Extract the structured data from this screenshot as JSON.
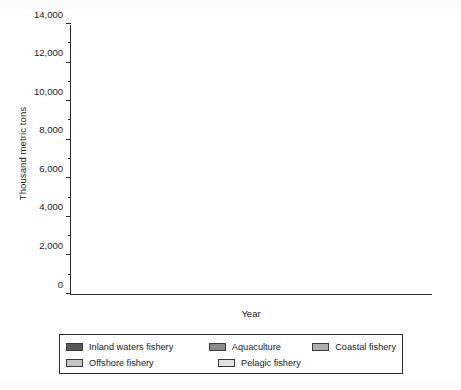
{
  "axes": {
    "y_title": "Thousand metric tons",
    "x_title": "Year",
    "y_ticks": [
      "0",
      "2,000",
      "4,000",
      "6,000",
      "8,000",
      "10,000",
      "12,000",
      "14,000"
    ],
    "x_ticks": [
      "1980",
      "1990",
      "2000"
    ]
  },
  "legend": {
    "items": [
      {
        "label": "Inland waters fishery",
        "color": "#58585a"
      },
      {
        "label": "Aquaculture",
        "color": "#8a8a8c"
      },
      {
        "label": "Coastal fishery",
        "color": "#aeaeb0"
      },
      {
        "label": "Offshore fishery",
        "color": "#c6c6c8"
      },
      {
        "label": "Pelagic fishery",
        "color": "#e2e2e3"
      }
    ]
  },
  "chart_data": {
    "type": "bar",
    "stacked": true,
    "title": "",
    "xlabel": "Year",
    "ylabel": "Thousand metric tons",
    "ylim": [
      0,
      14000
    ],
    "ytick_step": 2000,
    "grid": false,
    "legend_position": "bottom",
    "categories": [
      "1979",
      "1980",
      "1981",
      "1982",
      "1983",
      "1984",
      "1985",
      "1986",
      "1987",
      "1988",
      "1989",
      "1990",
      "1991",
      "1992",
      "1993",
      "1994",
      "1995",
      "1996",
      "1997",
      "1998",
      "1999",
      "2000",
      "2001",
      "2002",
      "2003",
      "2004"
    ],
    "series": [
      {
        "name": "Pelagic fishery",
        "color": "#e2e2e3",
        "values": [
          2080,
          2160,
          2150,
          2090,
          2120,
          2270,
          2110,
          2320,
          2350,
          2250,
          1990,
          1500,
          1210,
          1310,
          1160,
          1100,
          960,
          880,
          910,
          860,
          860,
          900,
          780,
          740,
          680,
          650
        ]
      },
      {
        "name": "Offshore fishery",
        "color": "#c6c6c8",
        "values": [
          5430,
          5720,
          5940,
          6060,
          6400,
          6940,
          6480,
          6780,
          6590,
          6880,
          6380,
          6100,
          5060,
          4490,
          4280,
          3710,
          3270,
          3210,
          3330,
          2920,
          2770,
          2600,
          2450,
          2520,
          2250,
          2560
        ]
      },
      {
        "name": "Coastal fishery",
        "color": "#aeaeb0",
        "values": [
          1960,
          1700,
          2010,
          2060,
          2130,
          2280,
          2320,
          2110,
          2260,
          2230,
          2120,
          1960,
          1950,
          1990,
          1900,
          1920,
          1800,
          1880,
          1780,
          1660,
          1580,
          1580,
          1560,
          1520,
          1520,
          1560
        ]
      },
      {
        "name": "Aquaculture",
        "color": "#8a8a8c",
        "values": [
          980,
          1350,
          1150,
          1080,
          1250,
          1210,
          1240,
          1180,
          1140,
          1370,
          1390,
          1380,
          1370,
          1420,
          1360,
          1350,
          1340,
          1330,
          1290,
          1300,
          1290,
          1230,
          1310,
          1310,
          1300,
          1270
        ]
      },
      {
        "name": "Inland waters fishery",
        "color": "#58585a",
        "values": [
          150,
          180,
          160,
          150,
          160,
          180,
          170,
          170,
          180,
          180,
          150,
          150,
          140,
          130,
          120,
          110,
          140,
          150,
          140,
          130,
          120,
          120,
          110,
          110,
          100,
          100
        ]
      }
    ]
  }
}
